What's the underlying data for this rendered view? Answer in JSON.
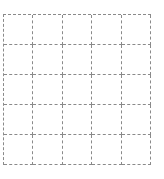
{
  "grid": {
    "rows": 5,
    "columns": 5,
    "line_style": "dashed",
    "line_color": "#8a8a8a",
    "background": "#ffffff"
  }
}
